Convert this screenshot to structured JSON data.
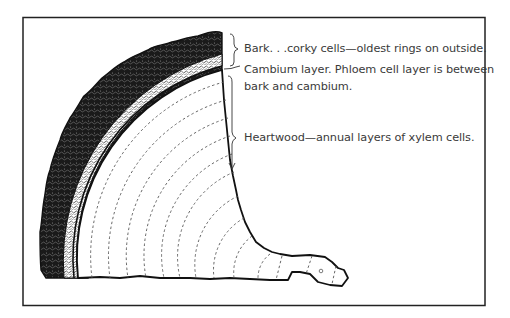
{
  "diagram": {
    "labels": {
      "bark": "Bark. . .corky cells—oldest rings on outside.",
      "cambium_line1": "Cambium layer. Phloem cell layer is between",
      "cambium_line2": "bark and cambium.",
      "heartwood": "Heartwood—annual layers of xylem cells."
    },
    "colors": {
      "ink": "#1a1a1a",
      "text": "#3a3a3a",
      "background": "#ffffff",
      "rings": "#555555"
    }
  }
}
